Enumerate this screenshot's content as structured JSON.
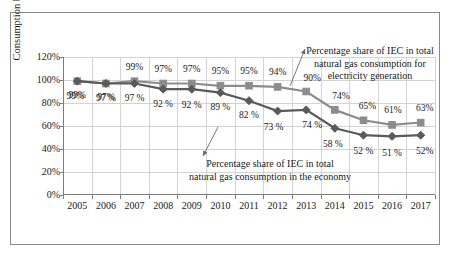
{
  "chart_data": {
    "type": "line",
    "title": "",
    "xlabel": "",
    "ylabel": "Consumption by the IEC (in %)",
    "categories": [
      "2005",
      "2006",
      "2007",
      "2008",
      "2009",
      "2010",
      "2011",
      "2012",
      "2013",
      "2014",
      "2015",
      "2016",
      "2017"
    ],
    "ylim": [
      0,
      120
    ],
    "ytick_labels": [
      "0%",
      "20%",
      "40%",
      "60%",
      "80%",
      "100%",
      "120%"
    ],
    "ytick_values": [
      0,
      20,
      40,
      60,
      80,
      100,
      120
    ],
    "grid": true,
    "legend_position": "none",
    "series": [
      {
        "name": "Percentage share of IEC in total natural gas consumption for electricity generation",
        "marker": "square",
        "color": "#8c8c8c",
        "values": [
          99,
          97,
          99,
          97,
          97,
          95,
          95,
          94,
          90,
          74,
          65,
          61,
          63
        ],
        "labels": [
          "99%",
          "97%",
          "99%",
          "97%",
          "97%",
          "95%",
          "95%",
          "94%",
          "90%",
          "74%",
          "65%",
          "61%",
          "63%"
        ]
      },
      {
        "name": "Percentage share of IEC in total natural gas consumption in the economy",
        "marker": "diamond",
        "color": "#5a5a5a",
        "values": [
          99,
          97,
          97,
          92,
          92,
          89,
          82,
          73,
          74,
          58,
          52,
          51,
          52
        ],
        "labels": [
          "99%",
          "97 %",
          "97 %",
          "92 %",
          "92 %",
          "89 %",
          "82 %",
          "73 %",
          "74 %",
          "58 %",
          "52 %",
          "51 %",
          "52%"
        ]
      }
    ],
    "annotations": [
      {
        "id": "electricity",
        "lines": [
          "Percentage share of IEC in total",
          "natural gas consumption for",
          "electricity generation"
        ],
        "target_series": 0,
        "target_category": "2013"
      },
      {
        "id": "economy",
        "lines": [
          "Percentage share of IEC in total",
          "natural gas consumption in the economy"
        ],
        "target_series": 1,
        "target_category": "2011"
      }
    ]
  },
  "axis": {
    "y_title": "Consumption by the IEC (in %)"
  },
  "annotations": {
    "electricity": {
      "line1": "Percentage share of IEC in total",
      "line2": "natural gas consumption for",
      "line3": "electricity generation"
    },
    "economy": {
      "line1": "Percentage share of IEC in total",
      "line2": "natural gas consumption in the economy"
    }
  },
  "colors": {
    "series_upper": "#8c8c8c",
    "series_lower": "#5a5a5a",
    "grid": "#d3d3d3",
    "axis": "#7d7d7d",
    "frame": "#8a8a8a",
    "text": "#1a1a1a"
  }
}
